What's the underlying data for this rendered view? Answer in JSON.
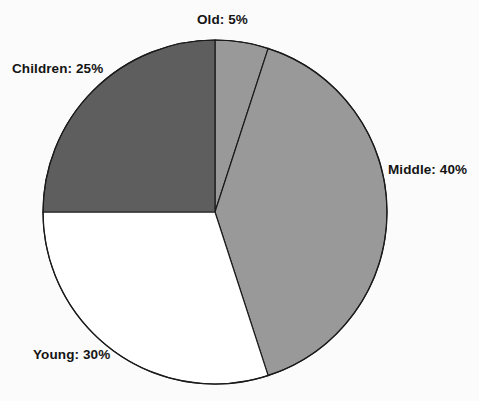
{
  "chart_data": {
    "type": "pie",
    "title": "",
    "subtitle": "",
    "xlabel": "",
    "ylabel": "",
    "legend_position": "none",
    "grid": false,
    "label_format": "{name}: {value}%",
    "start_angle_deg": 0,
    "direction": "clockwise",
    "categories": [
      "Old",
      "Middle",
      "Young",
      "Children"
    ],
    "values": [
      5,
      40,
      30,
      25
    ],
    "units": "%",
    "slices": [
      {
        "name": "Old",
        "value": 5,
        "label": "Old: 5%",
        "color": "#999999",
        "start_deg": 0,
        "end_deg": 18,
        "label_position": "top"
      },
      {
        "name": "Middle",
        "value": 40,
        "label": "Middle: 40%",
        "color": "#999999",
        "start_deg": 18,
        "end_deg": 162,
        "label_position": "right"
      },
      {
        "name": "Young",
        "value": 30,
        "label": "Young: 30%",
        "color": "#ffffff",
        "start_deg": 162,
        "end_deg": 270,
        "label_position": "bottom-left"
      },
      {
        "name": "Children",
        "value": 25,
        "label": "Children: 25%",
        "color": "#5e5e5e",
        "start_deg": 270,
        "end_deg": 360,
        "label_position": "top-left"
      }
    ],
    "geometry": {
      "center_x": 215,
      "center_y": 212,
      "radius": 172
    },
    "style": {
      "background": "#fbfbfb",
      "outline_color": "#1a1a1a",
      "outline_width": 1.2,
      "label_color": "#141414"
    }
  }
}
